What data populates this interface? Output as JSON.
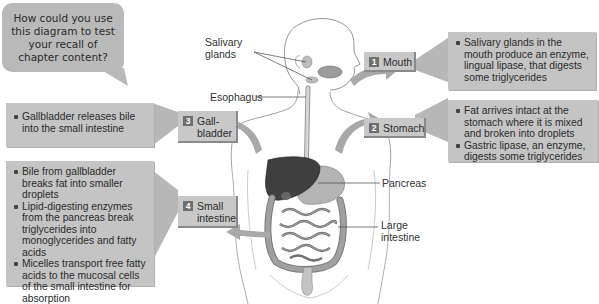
{
  "bubble": {
    "text": "How could you use this diagram to test your recall of chapter content?"
  },
  "anatomy_labels": {
    "salivary_glands": "Salivary glands",
    "esophagus": "Esophagus",
    "pancreas": "Pancreas",
    "large_intestine": "Large intestine"
  },
  "steps": [
    {
      "number": "1",
      "label": "Mouth",
      "bullets": [
        "Salivary glands in the mouth produce an enzyme, lingual lipase, that digests some triglycerides"
      ]
    },
    {
      "number": "2",
      "label": "Stomach",
      "bullets": [
        "Fat arrives intact at the stomach where it is mixed and broken into droplets",
        "Gastric lipase, an enzyme, digests some triglycerides"
      ]
    },
    {
      "number": "3",
      "label": "Gall-bladder",
      "bullets": [
        "Gallbladder releases bile into the small intestine"
      ]
    },
    {
      "number": "4",
      "label": "Small intestine",
      "bullets": [
        "Bile from gallbladder breaks fat into smaller droplets",
        "Lipid-digesting enzymes from the pancreas break triglycerides into monoglycerides and fatty acids",
        "Micelles transport free fatty acids to the mucosal cells of the small intestine for absorption"
      ]
    }
  ],
  "colors": {
    "box_fill": "#c4c4c4",
    "label_fill": "#c8c8c8",
    "number_fill": "#6f6f6f",
    "arrow_fill": "#a9a9a9",
    "liver": "#3f3f3f",
    "intestine": "#8c8c8c"
  }
}
